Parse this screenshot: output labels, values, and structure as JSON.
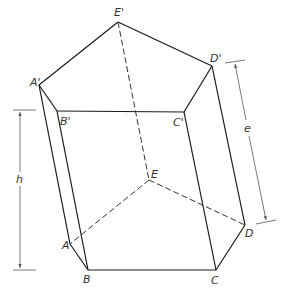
{
  "figure": {
    "colors": {
      "background": "#ffffff",
      "edge": "#1a1a1a",
      "hidden_edge": "#333333",
      "dimension": "#555555",
      "label": "#333333"
    },
    "vertices": {
      "A_top": {
        "label": "A'",
        "x": 39,
        "y": 85
      },
      "B_top": {
        "label": "B'",
        "x": 57,
        "y": 111
      },
      "C_top": {
        "label": "C'",
        "x": 184,
        "y": 112
      },
      "D_top": {
        "label": "D'",
        "x": 212,
        "y": 66
      },
      "E_top": {
        "label": "E'",
        "x": 118,
        "y": 22
      },
      "A": {
        "label": "A",
        "x": 70,
        "y": 244
      },
      "B": {
        "label": "B",
        "x": 88,
        "y": 270
      },
      "C": {
        "label": "C",
        "x": 216,
        "y": 270
      },
      "D": {
        "label": "D",
        "x": 245,
        "y": 225
      },
      "E": {
        "label": "E",
        "x": 149,
        "y": 180
      }
    },
    "labels": {
      "A_top": "A'",
      "B_top": "B'",
      "C_top": "C'",
      "D_top": "D'",
      "E_top": "E'",
      "A": "A",
      "B": "B",
      "C": "C",
      "D": "D",
      "E": "E"
    },
    "dimensions": {
      "height": {
        "label": "h"
      },
      "edge": {
        "label": "e"
      }
    }
  }
}
